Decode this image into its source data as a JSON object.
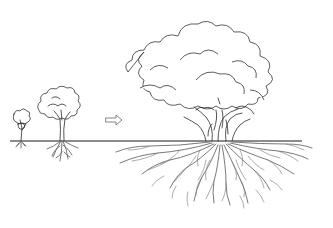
{
  "illustration": {
    "subject": "tree growth stages with root systems",
    "stages": [
      {
        "name": "seedling",
        "label": ""
      },
      {
        "name": "young-tree",
        "label": ""
      },
      {
        "name": "mature-tree",
        "label": ""
      }
    ],
    "arrow": {
      "direction": "right",
      "icon": "outline-arrow-icon"
    },
    "colors": {
      "background": "#ffffff",
      "line": "#2a2a2a",
      "roots": "#6a6a6a"
    }
  }
}
